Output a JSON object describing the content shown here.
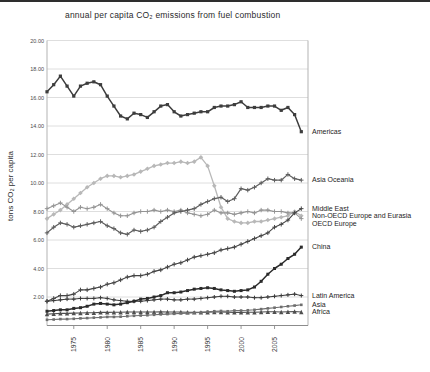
{
  "figure": {
    "title": "annual per capita CO₂ emissions from fuel combustion",
    "y_axis_label": "tons CO₂ per capita"
  },
  "chart_data": {
    "type": "line",
    "title": "annual per capita CO₂ emissions from fuel combustion",
    "xlabel": "",
    "ylabel": "tons CO₂ per capita",
    "xlim": [
      1971,
      2010
    ],
    "ylim": [
      0,
      20
    ],
    "grid": "horizontal",
    "legend_position": "right-annotations",
    "yticks": [
      2,
      4,
      6,
      8,
      10,
      12,
      14,
      16,
      18,
      20
    ],
    "xticks": [
      1975,
      1980,
      1985,
      1990,
      1995,
      2000,
      2005
    ],
    "x": [
      1971,
      1972,
      1973,
      1974,
      1975,
      1976,
      1977,
      1978,
      1979,
      1980,
      1981,
      1982,
      1983,
      1984,
      1985,
      1986,
      1987,
      1988,
      1989,
      1990,
      1991,
      1992,
      1993,
      1994,
      1995,
      1996,
      1997,
      1998,
      1999,
      2000,
      2001,
      2002,
      2003,
      2004,
      2005,
      2006,
      2007,
      2008,
      2009
    ],
    "series": [
      {
        "name": "Americas",
        "color": "#3d3d3d",
        "marker": "square",
        "line_width": 1.5,
        "marker_size": 3.2,
        "values": [
          16.4,
          16.9,
          17.5,
          16.8,
          16.1,
          16.8,
          17.0,
          17.1,
          16.9,
          16.1,
          15.4,
          14.7,
          14.5,
          14.9,
          14.8,
          14.6,
          15.0,
          15.4,
          15.5,
          15.0,
          14.7,
          14.8,
          14.9,
          15.0,
          15.0,
          15.3,
          15.4,
          15.4,
          15.5,
          15.7,
          15.3,
          15.3,
          15.3,
          15.4,
          15.4,
          15.1,
          15.3,
          14.8,
          13.6
        ]
      },
      {
        "name": "Asia Oceania",
        "color": "#5e5e5e",
        "marker": "plus",
        "line_width": 1.2,
        "marker_size": 2.2,
        "values": [
          6.5,
          6.9,
          7.2,
          7.1,
          6.9,
          7.0,
          7.1,
          7.2,
          7.3,
          7.0,
          6.8,
          6.5,
          6.4,
          6.7,
          6.6,
          6.7,
          6.9,
          7.3,
          7.6,
          7.9,
          8.0,
          8.1,
          8.2,
          8.5,
          8.7,
          8.9,
          9.0,
          8.7,
          8.9,
          9.6,
          9.5,
          9.7,
          10.0,
          10.3,
          10.2,
          10.2,
          10.6,
          10.3,
          10.2
        ]
      },
      {
        "name": "Middle East",
        "color": "#454545",
        "marker": "plus",
        "line_width": 1.1,
        "marker_size": 2.2,
        "values": [
          1.7,
          1.9,
          2.1,
          2.1,
          2.2,
          2.5,
          2.5,
          2.6,
          2.7,
          2.9,
          3.0,
          3.2,
          3.4,
          3.5,
          3.5,
          3.6,
          3.8,
          3.9,
          4.1,
          4.3,
          4.4,
          4.6,
          4.8,
          4.9,
          5.0,
          5.1,
          5.3,
          5.4,
          5.5,
          5.7,
          5.9,
          6.1,
          6.3,
          6.5,
          6.9,
          7.1,
          7.4,
          7.9,
          8.2
        ]
      },
      {
        "name": "Non-OECD Europe and Eurasia",
        "color": "#b8b8b8",
        "marker": "diamond",
        "line_width": 1.3,
        "marker_size": 2.3,
        "values": [
          7.5,
          7.8,
          8.1,
          8.5,
          8.9,
          9.3,
          9.7,
          10.0,
          10.3,
          10.5,
          10.5,
          10.4,
          10.5,
          10.6,
          10.8,
          11.0,
          11.2,
          11.3,
          11.4,
          11.4,
          11.5,
          11.4,
          11.5,
          11.8,
          11.2,
          9.8,
          8.3,
          7.5,
          7.3,
          7.2,
          7.2,
          7.3,
          7.3,
          7.4,
          7.5,
          7.6,
          7.7,
          8.0,
          7.7
        ]
      },
      {
        "name": "OECD Europe",
        "color": "#949494",
        "marker": "plus",
        "line_width": 1.1,
        "marker_size": 2.2,
        "values": [
          8.2,
          8.4,
          8.6,
          8.3,
          8.0,
          8.3,
          8.2,
          8.3,
          8.5,
          8.2,
          7.9,
          7.7,
          7.7,
          7.9,
          8.0,
          8.0,
          8.1,
          8.0,
          8.1,
          8.0,
          8.1,
          7.9,
          7.8,
          7.7,
          7.8,
          8.1,
          7.9,
          7.9,
          7.8,
          7.9,
          8.0,
          7.9,
          8.1,
          8.1,
          8.0,
          8.0,
          7.9,
          7.9,
          7.5
        ]
      },
      {
        "name": "China",
        "color": "#2b2b2b",
        "marker": "square",
        "line_width": 1.5,
        "marker_size": 3.0,
        "values": [
          1.0,
          1.05,
          1.1,
          1.1,
          1.2,
          1.25,
          1.35,
          1.5,
          1.55,
          1.5,
          1.45,
          1.5,
          1.6,
          1.7,
          1.85,
          1.9,
          2.0,
          2.1,
          2.3,
          2.3,
          2.35,
          2.45,
          2.55,
          2.6,
          2.65,
          2.6,
          2.5,
          2.45,
          2.4,
          2.45,
          2.5,
          2.7,
          3.1,
          3.6,
          4.0,
          4.3,
          4.7,
          5.0,
          5.5
        ]
      },
      {
        "name": "Latin America",
        "color": "#3a3a3a",
        "marker": "plus",
        "line_width": 1.0,
        "marker_size": 2.0,
        "values": [
          1.7,
          1.75,
          1.8,
          1.85,
          1.85,
          1.9,
          1.9,
          1.9,
          1.95,
          1.9,
          1.8,
          1.75,
          1.7,
          1.7,
          1.7,
          1.75,
          1.8,
          1.85,
          1.85,
          1.8,
          1.8,
          1.85,
          1.85,
          1.9,
          1.95,
          2.0,
          2.05,
          2.05,
          2.0,
          2.0,
          2.0,
          1.95,
          1.95,
          2.0,
          2.05,
          2.1,
          2.15,
          2.2,
          2.1
        ]
      },
      {
        "name": "Asia",
        "color": "#6e6e6e",
        "marker": "square",
        "line_width": 1.1,
        "marker_size": 2.6,
        "values": [
          0.4,
          0.42,
          0.45,
          0.45,
          0.47,
          0.5,
          0.52,
          0.55,
          0.57,
          0.6,
          0.6,
          0.62,
          0.65,
          0.68,
          0.7,
          0.72,
          0.75,
          0.78,
          0.8,
          0.82,
          0.85,
          0.87,
          0.9,
          0.92,
          0.97,
          1.0,
          1.02,
          1.0,
          1.05,
          1.05,
          1.07,
          1.1,
          1.15,
          1.2,
          1.25,
          1.3,
          1.35,
          1.4,
          1.45
        ]
      },
      {
        "name": "Africa",
        "color": "#4f4f4f",
        "marker": "triangle",
        "line_width": 1.1,
        "marker_size": 2.2,
        "values": [
          0.8,
          0.82,
          0.85,
          0.85,
          0.87,
          0.88,
          0.9,
          0.9,
          0.92,
          0.92,
          0.93,
          0.93,
          0.95,
          0.95,
          0.95,
          0.95,
          0.95,
          0.97,
          0.95,
          0.95,
          0.95,
          0.93,
          0.92,
          0.92,
          0.93,
          0.95,
          0.95,
          0.93,
          0.92,
          0.92,
          0.93,
          0.93,
          0.95,
          0.97,
          0.97,
          0.95,
          0.97,
          0.98,
          0.95
        ]
      }
    ],
    "colors": {
      "grid": "#d6d6d6",
      "frame": "#b3b3b3",
      "axis": "#8c8c8c",
      "tick_text": "#4a4a4a",
      "label_text": "#1d1d1d"
    }
  }
}
